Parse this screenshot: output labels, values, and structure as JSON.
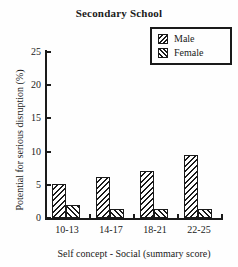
{
  "figure": {
    "kind": "scanned bar chart"
  },
  "chart_data": {
    "type": "bar",
    "title": "Secondary School",
    "xlabel": "Self concept - Social (summary score)",
    "ylabel": "Potential for serious disruption (%)",
    "categories": [
      "10-13",
      "14-17",
      "18-21",
      "22-25"
    ],
    "series": [
      {
        "name": "Male",
        "hatch": "///",
        "values": [
          5.1,
          6.2,
          7.1,
          9.5
        ]
      },
      {
        "name": "Female",
        "hatch": "\\\\\\",
        "values": [
          2.0,
          1.4,
          1.3,
          1.4
        ]
      }
    ],
    "ylim": [
      0,
      25
    ],
    "yticks": [
      0,
      5,
      10,
      15,
      20,
      25
    ],
    "legend_position": "top-right",
    "grid": false,
    "colors": {
      "ink": "#1a1a1a",
      "background": "#fefefe"
    }
  }
}
